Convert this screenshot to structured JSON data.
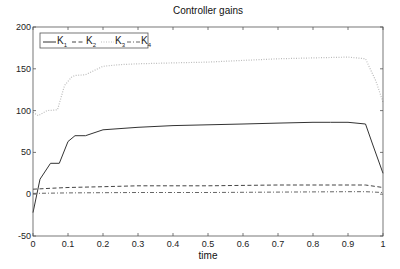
{
  "chart_data": {
    "type": "line",
    "title": "Controller gains",
    "xlabel": "time",
    "ylabel": "",
    "xlim": [
      0,
      1
    ],
    "ylim": [
      -50,
      200
    ],
    "xticks": [
      0,
      0.1,
      0.2,
      0.3,
      0.4,
      0.5,
      0.6,
      0.7,
      0.8,
      0.9,
      1
    ],
    "xtick_labels": [
      "0",
      "0.1",
      "0.2",
      "0.3",
      "0.4",
      "0.5",
      "0.6",
      "0.7",
      "0.8",
      "0.9",
      "1"
    ],
    "yticks": [
      -50,
      0,
      50,
      100,
      150,
      200
    ],
    "ytick_labels": [
      "-50",
      "0",
      "50",
      "100",
      "150",
      "200"
    ],
    "grid": false,
    "legend_position": "upper left",
    "legend": [
      "K1",
      "K2",
      "K3",
      "K4"
    ],
    "series": [
      {
        "name": "K1",
        "style": "solid",
        "color": "#333333",
        "x": [
          0,
          0.02,
          0.05,
          0.075,
          0.1,
          0.12,
          0.15,
          0.2,
          0.3,
          0.4,
          0.5,
          0.6,
          0.7,
          0.8,
          0.85,
          0.9,
          0.95,
          0.97,
          1.0
        ],
        "y": [
          -22,
          18,
          37,
          37,
          63,
          70,
          70,
          77,
          80,
          82,
          83,
          84,
          85,
          86,
          86,
          86,
          84,
          60,
          25
        ]
      },
      {
        "name": "K2",
        "style": "dashed",
        "color": "#444444",
        "x": [
          0,
          0.05,
          0.1,
          0.2,
          0.3,
          0.5,
          0.7,
          0.9,
          0.95,
          1.0
        ],
        "y": [
          6,
          7,
          8,
          9,
          10,
          10,
          11,
          11,
          11,
          8
        ]
      },
      {
        "name": "K3",
        "style": "dotted",
        "color": "#bbbbbb",
        "x": [
          0,
          0.015,
          0.04,
          0.07,
          0.09,
          0.11,
          0.12,
          0.15,
          0.2,
          0.25,
          0.3,
          0.4,
          0.5,
          0.6,
          0.7,
          0.8,
          0.9,
          0.95,
          0.98,
          1.0
        ],
        "y": [
          98,
          94,
          100,
          101,
          130,
          140,
          142,
          143,
          153,
          155,
          156,
          157,
          158,
          160,
          162,
          163,
          164,
          162,
          135,
          110
        ]
      },
      {
        "name": "K4",
        "style": "dashdot",
        "color": "#666666",
        "x": [
          0,
          0.1,
          0.3,
          0.5,
          0.7,
          0.9,
          0.95,
          1.0
        ],
        "y": [
          1,
          1.5,
          2,
          2,
          2.5,
          3,
          3,
          2
        ]
      }
    ]
  },
  "plot": {
    "left": 33,
    "top": 27,
    "right": 383,
    "bottom": 236
  }
}
